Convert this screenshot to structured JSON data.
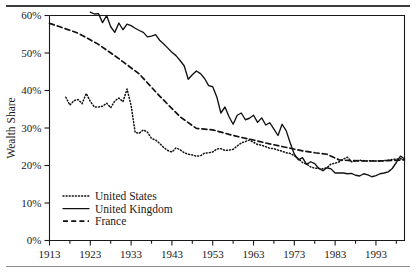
{
  "figure": {
    "has_top_rule": true,
    "has_bottom_rule": true,
    "background_color": "#ffffff",
    "line_color": "#111111"
  },
  "chart_data": {
    "type": "line",
    "title": "",
    "subtitle": "",
    "xlabel": "",
    "ylabel": "Wealth Share",
    "xlim": [
      1913,
      2000
    ],
    "ylim": [
      0,
      60
    ],
    "grid": false,
    "legend_position": "bottom-left",
    "x_tick_labels": [
      "1913",
      "1923",
      "1933",
      "1943",
      "1953",
      "1963",
      "1973",
      "1983",
      "1993"
    ],
    "x_tick_values": [
      1913,
      1923,
      1933,
      1943,
      1953,
      1963,
      1973,
      1983,
      1993
    ],
    "x_minor_tick_values": [
      1918,
      1928,
      1938,
      1948,
      1958,
      1968,
      1978,
      1988,
      1998
    ],
    "y_tick_labels": [
      "0%",
      "10%",
      "20%",
      "30%",
      "40%",
      "50%",
      "60%"
    ],
    "y_tick_values": [
      0,
      10,
      20,
      30,
      40,
      50,
      60
    ],
    "series": [
      {
        "name": "United States",
        "style": "dotted",
        "x": [
          1917,
          1918,
          1919,
          1920,
          1921,
          1922,
          1923,
          1924,
          1925,
          1926,
          1927,
          1928,
          1929,
          1930,
          1931,
          1932,
          1933,
          1934,
          1935,
          1936,
          1937,
          1938,
          1939,
          1940,
          1941,
          1942,
          1943,
          1944,
          1945,
          1946,
          1947,
          1948,
          1949,
          1950,
          1951,
          1952,
          1953,
          1954,
          1955,
          1956,
          1957,
          1958,
          1959,
          1960,
          1961,
          1962,
          1963,
          1964,
          1965,
          1966,
          1967,
          1968,
          1969,
          1970,
          1971,
          1972,
          1973,
          1974,
          1975,
          1976,
          1977,
          1978,
          1979,
          1980,
          1981,
          1982,
          1983,
          1984,
          1985,
          1986,
          1987,
          1988,
          1989,
          1990,
          1991,
          1992,
          1993,
          1994,
          1995,
          1996,
          1997,
          1998,
          1999,
          2000
        ],
        "values": [
          38.2,
          36.1,
          37.3,
          37.6,
          36.5,
          39.2,
          37.1,
          35.6,
          35.6,
          35.8,
          36.6,
          35.4,
          37.2,
          38.0,
          37.0,
          40.4,
          36.0,
          28.8,
          28.6,
          29.5,
          28.9,
          27.2,
          26.8,
          25.9,
          24.8,
          24.0,
          23.6,
          24.7,
          24.2,
          23.4,
          23.0,
          22.8,
          22.5,
          22.6,
          23.3,
          23.4,
          23.6,
          24.4,
          24.5,
          24.0,
          24.1,
          24.3,
          25.2,
          26.0,
          26.4,
          26.8,
          26.2,
          25.6,
          25.4,
          25.0,
          24.6,
          24.5,
          24.1,
          23.8,
          23.4,
          23.2,
          22.6,
          21.8,
          20.8,
          20.4,
          19.6,
          19.3,
          19.2,
          19.1,
          19.4,
          20.4,
          20.6,
          21.0,
          21.7,
          22.2,
          21.0,
          21.2,
          21.4,
          21.3,
          21.2,
          21.3,
          21.2,
          21.2,
          21.3,
          21.4,
          21.6,
          21.7,
          21.8,
          21.6
        ]
      },
      {
        "name": "United Kingdom",
        "style": "solid",
        "x": [
          1923,
          1924,
          1925,
          1926,
          1927,
          1928,
          1929,
          1930,
          1931,
          1932,
          1933,
          1934,
          1935,
          1936,
          1937,
          1938,
          1939,
          1940,
          1941,
          1942,
          1943,
          1944,
          1945,
          1946,
          1947,
          1948,
          1949,
          1950,
          1951,
          1952,
          1953,
          1954,
          1955,
          1956,
          1957,
          1958,
          1959,
          1960,
          1961,
          1962,
          1963,
          1964,
          1965,
          1966,
          1967,
          1968,
          1969,
          1970,
          1971,
          1972,
          1973,
          1974,
          1975,
          1976,
          1977,
          1978,
          1979,
          1980,
          1981,
          1982,
          1983,
          1984,
          1985,
          1986,
          1987,
          1988,
          1989,
          1990,
          1991,
          1992,
          1993,
          1994,
          1995,
          1996,
          1997,
          1998,
          1999,
          2000
        ],
        "values": [
          60.9,
          60.4,
          60.5,
          58.1,
          60.0,
          57.0,
          55.5,
          58.0,
          56.2,
          57.7,
          57.3,
          56.6,
          56.0,
          55.5,
          54.3,
          54.5,
          54.9,
          53.4,
          52.4,
          51.3,
          50.2,
          49.3,
          48.0,
          46.6,
          43.0,
          44.2,
          45.2,
          44.5,
          43.2,
          41.3,
          41.0,
          38.3,
          34.0,
          35.6,
          33.0,
          31.0,
          33.4,
          34.0,
          32.2,
          32.6,
          33.4,
          31.5,
          32.7,
          30.8,
          31.4,
          29.7,
          28.0,
          31.0,
          29.3,
          26.0,
          23.0,
          21.5,
          22.1,
          20.3,
          21.0,
          20.5,
          19.2,
          18.6,
          19.4,
          19.1,
          18.0,
          18.0,
          18.0,
          17.8,
          17.9,
          17.4,
          17.2,
          17.8,
          17.5,
          17.0,
          17.3,
          17.8,
          18.0,
          18.3,
          19.2,
          20.8,
          22.5,
          21.8
        ]
      },
      {
        "name": "France",
        "style": "dashed",
        "x": [
          1913,
          1915,
          1920,
          1925,
          1930,
          1935,
          1940,
          1945,
          1949,
          1953,
          1957,
          1960,
          1963,
          1966,
          1969,
          1972,
          1975,
          1978,
          1981,
          1984,
          1987,
          1990,
          1993,
          1996,
          2000
        ],
        "values": [
          57.9,
          57.2,
          55.3,
          52.3,
          48.5,
          44.4,
          38.5,
          33.0,
          29.9,
          29.5,
          28.3,
          27.5,
          26.8,
          26.0,
          25.3,
          24.6,
          23.9,
          23.4,
          23.0,
          21.5,
          21.3,
          21.2,
          21.2,
          21.3,
          21.5
        ]
      }
    ]
  },
  "legend": {
    "items": [
      {
        "label": "United States",
        "style": "dotted"
      },
      {
        "label": "United Kingdom",
        "style": "solid"
      },
      {
        "label": "France",
        "style": "dashed"
      }
    ]
  }
}
